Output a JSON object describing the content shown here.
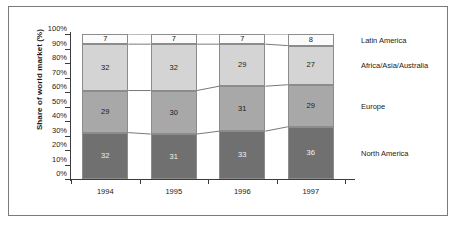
{
  "chart_data": {
    "type": "bar",
    "stacked": true,
    "title": "",
    "subtitle": "",
    "xlabel": "",
    "ylabel": "Share of world market (%)",
    "ylim": [
      0,
      100
    ],
    "ytick_labels": [
      "100%",
      "90%",
      "80%",
      "70%",
      "60%",
      "50%",
      "40%",
      "30%",
      "20%",
      "10%",
      "0%"
    ],
    "ytick_values": [
      100,
      90,
      80,
      70,
      60,
      50,
      40,
      30,
      20,
      10,
      0
    ],
    "grid": false,
    "legend_position": "right-inline",
    "categories": [
      "1994",
      "1995",
      "1996",
      "1997"
    ],
    "series": [
      {
        "name": "North America",
        "color": "#707070",
        "values": [
          32,
          31,
          33,
          36
        ]
      },
      {
        "name": "Europe",
        "color": "#a8a8a8",
        "values": [
          29,
          30,
          31,
          29
        ]
      },
      {
        "name": "Africa/Asia/Australia",
        "color": "#d4d4d4",
        "values": [
          32,
          32,
          29,
          27
        ]
      },
      {
        "name": "Latin America",
        "color": "#fbfbfb",
        "values": [
          7,
          7,
          7,
          8
        ]
      }
    ],
    "annotations": [
      "Segment boundaries connected by thin lines across bars"
    ]
  },
  "axis": {
    "ylabel_text": "Share of world market (%)"
  }
}
